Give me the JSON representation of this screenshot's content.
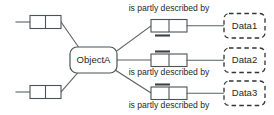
{
  "diagram": {
    "type": "entity-relationship-diagram",
    "background_color": "#ffffff",
    "line_color": "#5a5f66",
    "text_color": "#23282c",
    "central_node": {
      "label": "ObjectA",
      "shape": "rounded-rectangle",
      "border_style": "solid"
    },
    "data_nodes": [
      {
        "label": "Data1",
        "shape": "rounded-rectangle",
        "border_style": "dashed"
      },
      {
        "label": "Data2",
        "shape": "rounded-rectangle",
        "border_style": "dashed"
      },
      {
        "label": "Data3",
        "shape": "rounded-rectangle",
        "border_style": "dashed"
      }
    ],
    "edge_labels": [
      {
        "text": "is partly described by"
      },
      {
        "text": "is partly described by"
      },
      {
        "text": "is partly described by"
      }
    ],
    "association_boxes": [
      {
        "id": "assoc-top-left",
        "cells": 2,
        "bar": "none"
      },
      {
        "id": "assoc-bottom-left",
        "cells": 2,
        "bar": "none"
      },
      {
        "id": "assoc-data1",
        "cells": 2,
        "bar": "below"
      },
      {
        "id": "assoc-data2",
        "cells": 2,
        "bar": "above"
      },
      {
        "id": "assoc-data3",
        "cells": 2,
        "bar": "above"
      }
    ]
  }
}
